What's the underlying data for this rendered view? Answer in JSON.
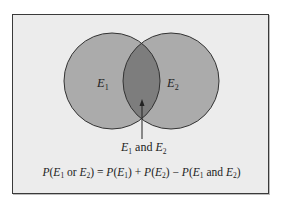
{
  "diagram": {
    "type": "venn",
    "frame": {
      "background": "#ececec",
      "border": "#3a3a3a"
    },
    "circles": [
      {
        "id": "E1",
        "label_main": "E",
        "label_sub": "1",
        "cx": 112,
        "cy": 81,
        "r": 48,
        "fill": "#ababab",
        "stroke": "#333333"
      },
      {
        "id": "E2",
        "label_main": "E",
        "label_sub": "2",
        "cx": 171,
        "cy": 81,
        "r": 48,
        "fill": "#ababab",
        "stroke": "#333333"
      }
    ],
    "intersection": {
      "fill": "#7d7d7d",
      "label": {
        "e1_main": "E",
        "e1_sub": "1",
        "conj": " and ",
        "e2_main": "E",
        "e2_sub": "2"
      }
    },
    "arrow": {
      "x": 142,
      "y_from": 139,
      "y_to": 100
    },
    "formula": {
      "p": "P",
      "open": "(",
      "close": ")",
      "e": "E",
      "sub1": "1",
      "sub2": "2",
      "or": " or ",
      "and": " and ",
      "eq": " = ",
      "plus": " + ",
      "minus": " − "
    }
  }
}
